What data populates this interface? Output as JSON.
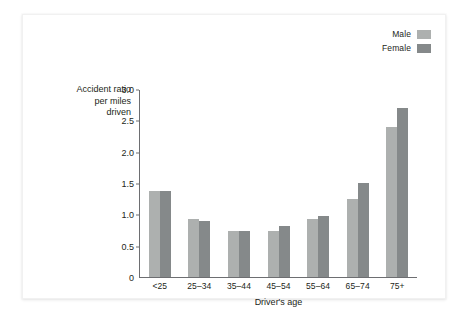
{
  "chart_data": {
    "type": "bar",
    "title": "",
    "xlabel": "Driver's age",
    "ylabel": "Accident ratio per miles driven",
    "ylabel_lines": [
      "Accident ratio",
      "per miles",
      "driven"
    ],
    "categories": [
      "<25",
      "25–34",
      "35–44",
      "45–54",
      "55–64",
      "65–74",
      "75+"
    ],
    "series": [
      {
        "name": "Male",
        "color": "#adb0af",
        "values": [
          1.38,
          0.93,
          0.74,
          0.74,
          0.93,
          1.24,
          2.39
        ]
      },
      {
        "name": "Female",
        "color": "#85898a",
        "values": [
          1.37,
          0.9,
          0.74,
          0.82,
          0.98,
          1.5,
          2.7
        ]
      }
    ],
    "ylim": [
      0,
      3.0
    ],
    "ytick_values": [
      0,
      0.5,
      1.0,
      1.5,
      2.0,
      2.5,
      3.0
    ],
    "ytick_labels": [
      "0",
      "0.5",
      "1.0",
      "1.5",
      "2.0",
      "2.5",
      "3.0"
    ],
    "grid": false,
    "legend_position": "top-right",
    "axis_color": "#6d6e71",
    "text_color": "#231f20",
    "background": "#ffffff"
  },
  "legend": {
    "entries": [
      {
        "label": "Male",
        "swatch_name": "legend-swatch-male"
      },
      {
        "label": "Female",
        "swatch_name": "legend-swatch-female"
      }
    ]
  }
}
